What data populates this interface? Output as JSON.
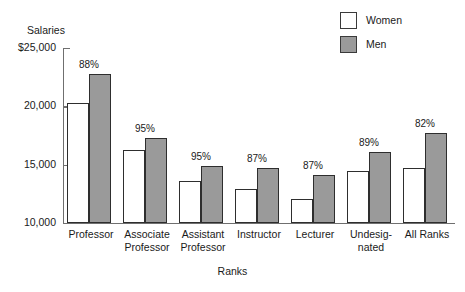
{
  "chart_data": {
    "type": "bar",
    "title": "",
    "subtitle": "",
    "xlabel": "Ranks",
    "ylabel": "Salaries",
    "ylim": [
      10000,
      25000
    ],
    "grid": false,
    "legend_position": "top-right",
    "y_ticks": [
      {
        "value": 25000,
        "label": "$25,000"
      },
      {
        "value": 20000,
        "label": "20,000"
      },
      {
        "value": 15000,
        "label": "15,000"
      },
      {
        "value": 10000,
        "label": "10,000"
      }
    ],
    "categories": [
      "Professor",
      "Associate Professor",
      "Assistant Professor",
      "Instructor",
      "Lecturer",
      "Undesignated",
      "All Ranks"
    ],
    "category_label_lines": [
      [
        "Professor"
      ],
      [
        "Associate",
        "Professor"
      ],
      [
        "Assistant",
        "Professor"
      ],
      [
        "Instructor"
      ],
      [
        "Lecturer"
      ],
      [
        "Undesig-",
        "nated"
      ],
      [
        "All Ranks"
      ]
    ],
    "series": [
      {
        "name": "Women",
        "color": "#ffffff",
        "values": [
          20250,
          16300,
          13600,
          12900,
          12050,
          14500,
          14700
        ]
      },
      {
        "name": "Men",
        "color": "#9a9a9a",
        "values": [
          22750,
          17300,
          14850,
          14700,
          14100,
          16100,
          17750
        ]
      }
    ],
    "annotations": [
      "88%",
      "95%",
      "95%",
      "87%",
      "87%",
      "89%",
      "82%"
    ],
    "annotation_note": "Women's salary as a percent of men's salary, shown above each group"
  },
  "legend": {
    "items": [
      {
        "label": "Women",
        "swatch": "white-square"
      },
      {
        "label": "Men",
        "swatch": "gray-square"
      }
    ]
  },
  "axes": {
    "y_title": "Salaries",
    "x_title": "Ranks"
  }
}
